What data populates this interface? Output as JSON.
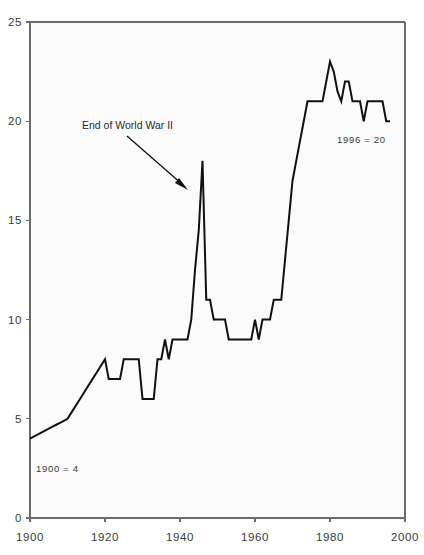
{
  "chart_data": {
    "type": "line",
    "title": "",
    "subtitle": "",
    "xlabel": "",
    "ylabel": "",
    "xlim": [
      1900,
      2000
    ],
    "ylim": [
      0,
      25
    ],
    "grid": false,
    "legend": false,
    "legend_position": "none",
    "x_ticks": [
      1900,
      1920,
      1940,
      1960,
      1980,
      2000
    ],
    "x_tick_labels": [
      "1900",
      "1920",
      "1940",
      "1960",
      "1980",
      "2000"
    ],
    "y_ticks": [
      0,
      5,
      10,
      15,
      20,
      25
    ],
    "y_tick_labels": [
      "0",
      "5",
      "10",
      "15",
      "20",
      "25"
    ],
    "series": [
      {
        "name": "value",
        "x": [
          1900,
          1901,
          1902,
          1903,
          1904,
          1905,
          1906,
          1907,
          1908,
          1909,
          1910,
          1911,
          1912,
          1913,
          1914,
          1915,
          1916,
          1917,
          1918,
          1919,
          1920,
          1921,
          1922,
          1923,
          1924,
          1925,
          1926,
          1927,
          1928,
          1929,
          1930,
          1931,
          1932,
          1933,
          1934,
          1935,
          1936,
          1937,
          1938,
          1939,
          1940,
          1941,
          1942,
          1943,
          1944,
          1945,
          1946,
          1947,
          1948,
          1949,
          1950,
          1951,
          1952,
          1953,
          1954,
          1955,
          1956,
          1957,
          1958,
          1959,
          1960,
          1961,
          1962,
          1963,
          1964,
          1965,
          1966,
          1967,
          1968,
          1969,
          1970,
          1971,
          1972,
          1973,
          1974,
          1975,
          1976,
          1977,
          1978,
          1979,
          1980,
          1981,
          1982,
          1983,
          1984,
          1985,
          1986,
          1987,
          1988,
          1989,
          1990,
          1991,
          1992,
          1993,
          1994,
          1995,
          1996
        ],
        "y": [
          4,
          4.1,
          4.2,
          4.3,
          4.4,
          4.5,
          4.6,
          4.7,
          4.8,
          4.9,
          5,
          5.3,
          5.6,
          5.9,
          6.2,
          6.5,
          6.8,
          7.1,
          7.4,
          7.7,
          8,
          7,
          7,
          7,
          7,
          8,
          8,
          8,
          8,
          8,
          6,
          6,
          6,
          6,
          8,
          8,
          9,
          8,
          9,
          9,
          9,
          9,
          9,
          10,
          12.5,
          14.5,
          18,
          11,
          11,
          10,
          10,
          10,
          10,
          9,
          9,
          9,
          9,
          9,
          9,
          9,
          10,
          9,
          10,
          10,
          10,
          11,
          11,
          11,
          13,
          15,
          17,
          18,
          19,
          20,
          21,
          21,
          21,
          21,
          21,
          22,
          23,
          22.5,
          21.5,
          21,
          22,
          22,
          21,
          21,
          21,
          20,
          21,
          21,
          21,
          21,
          21,
          20,
          20
        ]
      }
    ],
    "annotations": [
      {
        "id": "wwii-label",
        "text": "End of World War II",
        "x": 1933,
        "y": 19,
        "arrow_to_x": 1944,
        "arrow_to_y": 16.6
      },
      {
        "id": "start-note",
        "text": "1900 = 4",
        "x": 1903,
        "y": 2.6
      },
      {
        "id": "end-note",
        "text": "1996 = 20",
        "x": 1982,
        "y": 18.8
      }
    ]
  },
  "colors": {
    "line": "#111111",
    "axis": "#6b6b6b",
    "plot_background": "#fbfbfb",
    "page_background": "#ffffff",
    "text": "#2b2b2b"
  }
}
